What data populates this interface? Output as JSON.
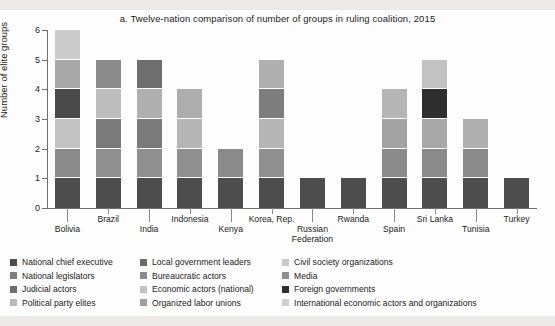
{
  "title": "a. Twelve-nation comparison of number of groups in ruling coalition, 2015",
  "chart_data": {
    "type": "bar",
    "title": "a. Twelve-nation comparison of number of groups in ruling coalition, 2015",
    "xlabel": "",
    "ylabel": "Number of elite groups",
    "ylim": [
      0,
      6
    ],
    "yticks": [
      "0",
      "1",
      "2",
      "3",
      "4",
      "5",
      "6"
    ],
    "grid": false,
    "stacked": true,
    "legend_position": "bottom",
    "categories": [
      "Bolivia",
      "Brazil",
      "India",
      "Indonesia",
      "Kenya",
      "Korea, Rep.",
      "Russian Federation",
      "Rwanda",
      "Spain",
      "Sri Lanka",
      "Tunisia",
      "Turkey"
    ],
    "totals": [
      6,
      5,
      5,
      4,
      2,
      5,
      1,
      1,
      4,
      5,
      3,
      1
    ],
    "series": [
      {
        "name": "National chief executive",
        "color": "#4d4d4d",
        "values": [
          1,
          1,
          1,
          1,
          1,
          1,
          1,
          1,
          1,
          1,
          1,
          1
        ]
      },
      {
        "name": "National legislators",
        "color": "#808080",
        "values": [
          1,
          1,
          1,
          1,
          1,
          1,
          0,
          0,
          1,
          1,
          1,
          0
        ]
      },
      {
        "name": "Judicial actors",
        "color": "#6e6e6e",
        "values": [
          1,
          0,
          0,
          0,
          0,
          0,
          0,
          0,
          0,
          0,
          0,
          0
        ]
      },
      {
        "name": "Political party elites",
        "color": "#3f3f3f",
        "values": [
          1,
          1,
          0,
          0,
          0,
          0,
          0,
          0,
          0,
          0,
          0,
          0
        ]
      },
      {
        "name": "Local government leaders",
        "color": "#737373",
        "values": [
          1,
          0,
          0,
          0,
          0,
          0,
          0,
          0,
          0,
          0,
          0,
          0
        ]
      },
      {
        "name": "Bureaucratic actors",
        "color": "#6a6a6a",
        "values": [
          0,
          1,
          1,
          0,
          0,
          1,
          0,
          0,
          0,
          1,
          0,
          0
        ]
      },
      {
        "name": "Economic actors (national)",
        "color": "#b0b0b0",
        "values": [
          0,
          1,
          1,
          0,
          0,
          1,
          0,
          0,
          1,
          1,
          0,
          0
        ]
      },
      {
        "name": "Organized labor unions",
        "color": "#9a9a9a",
        "values": [
          0,
          0,
          0,
          0,
          0,
          0,
          0,
          0,
          0,
          0,
          0,
          0
        ]
      },
      {
        "name": "Civil society organizations",
        "color": "#c4c4c4",
        "values": [
          1,
          0,
          0,
          1,
          0,
          1,
          0,
          0,
          1,
          1,
          1,
          0
        ]
      },
      {
        "name": "Media",
        "color": "#8f8f8f",
        "values": [
          0,
          0,
          1,
          0,
          0,
          0,
          0,
          0,
          0,
          0,
          0,
          0
        ]
      },
      {
        "name": "Foreign governments",
        "color": "#2e2e2e",
        "values": [
          0,
          0,
          0,
          0,
          0,
          0,
          0,
          0,
          0,
          1,
          0,
          0
        ]
      },
      {
        "name": "International economic actors and organizations",
        "color": "#cfcfcf",
        "values": [
          0,
          0,
          0,
          0,
          0,
          0,
          0,
          0,
          0,
          0,
          0,
          0
        ]
      }
    ],
    "bars": [
      {
        "category": "Bolivia",
        "total": 6,
        "segments": [
          {
            "label": "National chief executive",
            "value": 1,
            "color": "#4d4d4d"
          },
          {
            "label": "Local government leaders",
            "value": 1,
            "color": "#8a8a8a"
          },
          {
            "label": "Civil society organizations",
            "value": 1,
            "color": "#c2c2c2"
          },
          {
            "label": "Political party elites",
            "value": 1,
            "color": "#4a4a4a"
          },
          {
            "label": "National legislators",
            "value": 1,
            "color": "#a8a8a8"
          },
          {
            "label": "International economic actors and organizations",
            "value": 1,
            "color": "#cccccc"
          }
        ]
      },
      {
        "category": "Brazil",
        "total": 5,
        "segments": [
          {
            "label": "National chief executive",
            "value": 1,
            "color": "#4d4d4d"
          },
          {
            "label": "Bureaucratic actors",
            "value": 1,
            "color": "#8f8f8f"
          },
          {
            "label": "National legislators",
            "value": 1,
            "color": "#7a7a7a"
          },
          {
            "label": "Economic actors (national)",
            "value": 1,
            "color": "#bdbdbd"
          },
          {
            "label": "Local government leaders",
            "value": 1,
            "color": "#8a8a8a"
          }
        ]
      },
      {
        "category": "India",
        "total": 5,
        "segments": [
          {
            "label": "National chief executive",
            "value": 1,
            "color": "#4d4d4d"
          },
          {
            "label": "Bureaucratic actors",
            "value": 1,
            "color": "#8f8f8f"
          },
          {
            "label": "National legislators",
            "value": 1,
            "color": "#7a7a7a"
          },
          {
            "label": "Media",
            "value": 1,
            "color": "#b0b0b0"
          },
          {
            "label": "Judicial actors",
            "value": 1,
            "color": "#6e6e6e"
          }
        ]
      },
      {
        "category": "Indonesia",
        "total": 4,
        "segments": [
          {
            "label": "National chief executive",
            "value": 1,
            "color": "#4d4d4d"
          },
          {
            "label": "Bureaucratic actors",
            "value": 1,
            "color": "#8f8f8f"
          },
          {
            "label": "National legislators",
            "value": 1,
            "color": "#b5b5b5"
          },
          {
            "label": "Civil society organizations",
            "value": 1,
            "color": "#adadad"
          }
        ]
      },
      {
        "category": "Kenya",
        "total": 2,
        "segments": [
          {
            "label": "National chief executive",
            "value": 1,
            "color": "#4d4d4d"
          },
          {
            "label": "National legislators",
            "value": 1,
            "color": "#8a8a8a"
          }
        ]
      },
      {
        "category": "Korea, Rep.",
        "total": 5,
        "segments": [
          {
            "label": "National chief executive",
            "value": 1,
            "color": "#4d4d4d"
          },
          {
            "label": "National legislators",
            "value": 1,
            "color": "#8f8f8f"
          },
          {
            "label": "Economic actors (national)",
            "value": 1,
            "color": "#b5b5b5"
          },
          {
            "label": "Bureaucratic actors",
            "value": 1,
            "color": "#7d7d7d"
          },
          {
            "label": "Civil society organizations",
            "value": 1,
            "color": "#b0b0b0"
          }
        ]
      },
      {
        "category": "Russian Federation",
        "total": 1,
        "segments": [
          {
            "label": "National chief executive",
            "value": 1,
            "color": "#4d4d4d"
          }
        ]
      },
      {
        "category": "Rwanda",
        "total": 1,
        "segments": [
          {
            "label": "National chief executive",
            "value": 1,
            "color": "#4d4d4d"
          }
        ]
      },
      {
        "category": "Spain",
        "total": 4,
        "segments": [
          {
            "label": "National chief executive",
            "value": 1,
            "color": "#4d4d4d"
          },
          {
            "label": "National legislators",
            "value": 1,
            "color": "#8a8a8a"
          },
          {
            "label": "Economic actors (national)",
            "value": 1,
            "color": "#a3a3a3"
          },
          {
            "label": "Civil society organizations",
            "value": 1,
            "color": "#b5b5b5"
          }
        ]
      },
      {
        "category": "Sri Lanka",
        "total": 5,
        "segments": [
          {
            "label": "National chief executive",
            "value": 1,
            "color": "#4d4d4d"
          },
          {
            "label": "National legislators",
            "value": 1,
            "color": "#8a8a8a"
          },
          {
            "label": "Economic actors (national)",
            "value": 1,
            "color": "#a8a8a8"
          },
          {
            "label": "Foreign governments",
            "value": 1,
            "color": "#2e2e2e"
          },
          {
            "label": "Civil society organizations",
            "value": 1,
            "color": "#c2c2c2"
          }
        ]
      },
      {
        "category": "Tunisia",
        "total": 3,
        "segments": [
          {
            "label": "National chief executive",
            "value": 1,
            "color": "#4d4d4d"
          },
          {
            "label": "National legislators",
            "value": 1,
            "color": "#8a8a8a"
          },
          {
            "label": "Civil society organizations",
            "value": 1,
            "color": "#b0b0b0"
          }
        ]
      },
      {
        "category": "Turkey",
        "total": 1,
        "segments": [
          {
            "label": "National chief executive",
            "value": 1,
            "color": "#4d4d4d"
          }
        ]
      }
    ],
    "legend": [
      {
        "label": "National chief executive",
        "color": "#4d4d4d"
      },
      {
        "label": "National legislators",
        "color": "#7e7e7e"
      },
      {
        "label": "Judicial actors",
        "color": "#6e6e6e"
      },
      {
        "label": "Political party elites",
        "color": "#b9b9b9"
      },
      {
        "label": "Local government leaders",
        "color": "#6a6a6a"
      },
      {
        "label": "Bureaucratic actors",
        "color": "#8a8a8a"
      },
      {
        "label": "Economic actors (national)",
        "color": "#c2c2c2"
      },
      {
        "label": "Organized labor unions",
        "color": "#9f9f9f"
      },
      {
        "label": "Civil society organizations",
        "color": "#c9c9c9"
      },
      {
        "label": "Media",
        "color": "#8f8f8f"
      },
      {
        "label": "Foreign governments",
        "color": "#2e2e2e"
      },
      {
        "label": "International economic actors and organizations",
        "color": "#cfcfcf"
      }
    ]
  }
}
